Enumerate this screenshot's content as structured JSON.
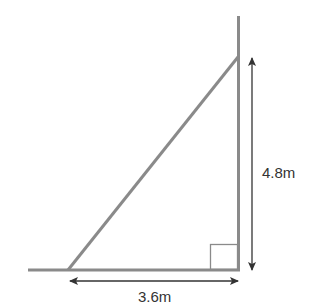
{
  "diagram": {
    "type": "right-triangle-ladder",
    "colors": {
      "structure": "#8a8a8a",
      "arrow": "#333333",
      "text": "#333333"
    },
    "labels": {
      "height": "4.8m",
      "base": "3.6m"
    },
    "dimensions": {
      "height_value": 4.8,
      "base_value": 3.6,
      "unit": "m"
    },
    "right_angle_marker": true
  }
}
